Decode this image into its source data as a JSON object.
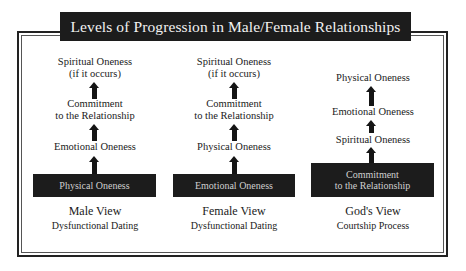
{
  "title": "Levels of Progression in Male/Female Relationships",
  "colors": {
    "dark": "#1c1c1c",
    "box_text": "#cfcfcf",
    "title_text": "#f2f2f2",
    "background": "#ffffff"
  },
  "columns": [
    {
      "id": "male",
      "levels_top_to_bottom": [
        {
          "line1": "Spiritual Oneness",
          "line2": "(if it occurs)"
        },
        {
          "line1": "Commitment",
          "line2": "to the Relationship"
        },
        {
          "line1": "Emotional Oneness"
        }
      ],
      "base": {
        "line1": "Physical Oneness"
      },
      "caption_title": "Male View",
      "caption_sub": "Dysfunctional Dating"
    },
    {
      "id": "female",
      "levels_top_to_bottom": [
        {
          "line1": "Spiritual Oneness",
          "line2": "(if it occurs)"
        },
        {
          "line1": "Commitment",
          "line2": "to the Relationship"
        },
        {
          "line1": "Physical Oneness"
        }
      ],
      "base": {
        "line1": "Emotional Oneness"
      },
      "caption_title": "Female View",
      "caption_sub": "Dysfunctional Dating"
    },
    {
      "id": "god",
      "levels_top_to_bottom": [
        {
          "line1": "Physical Oneness"
        },
        {
          "line1": "Emotional Oneness"
        },
        {
          "line1": "Spiritual Oneness"
        }
      ],
      "base": {
        "line1": "Commitment",
        "line2": "to the Relationship"
      },
      "caption_title": "God's View",
      "caption_sub": "Courtship Process"
    }
  ],
  "icons": {
    "arrow": "arrow-up-icon"
  }
}
